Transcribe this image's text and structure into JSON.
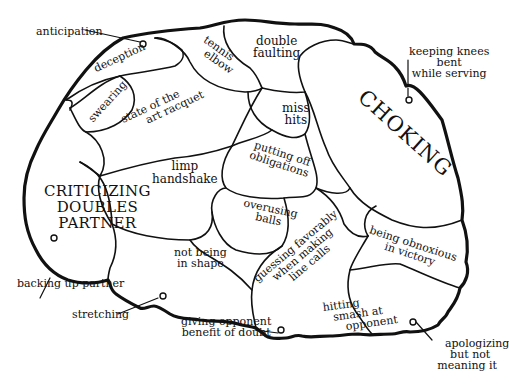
{
  "diagram": {
    "type": "brain-map",
    "stroke_color": "#111111",
    "background": "#ffffff",
    "regions": [
      {
        "id": "deception",
        "lines": [
          "deception"
        ]
      },
      {
        "id": "tennis-elbow",
        "lines": [
          "tennis",
          "elbow"
        ]
      },
      {
        "id": "double-faulting",
        "lines": [
          "double",
          "faulting"
        ]
      },
      {
        "id": "swearing",
        "lines": [
          "swearing"
        ]
      },
      {
        "id": "state-of-the-art-racquet",
        "lines": [
          "state of the",
          "art racquet"
        ]
      },
      {
        "id": "miss-hits",
        "lines": [
          "miss",
          "hits"
        ]
      },
      {
        "id": "choking",
        "lines": [
          "CHOKING"
        ]
      },
      {
        "id": "limp-handshake",
        "lines": [
          "limp",
          "handshake"
        ]
      },
      {
        "id": "putting-off-obligations",
        "lines": [
          "putting off",
          "obligations"
        ]
      },
      {
        "id": "criticizing-doubles-partner",
        "lines": [
          "CRITICIZING",
          "DOUBLES",
          "PARTNER"
        ]
      },
      {
        "id": "overusing-balls",
        "lines": [
          "overusing",
          "balls"
        ]
      },
      {
        "id": "guessing-favorably",
        "lines": [
          "guessing favorably",
          "when making",
          "line calls"
        ]
      },
      {
        "id": "not-being-in-shape",
        "lines": [
          "not being",
          "in shape"
        ]
      },
      {
        "id": "being-obnoxious",
        "lines": [
          "being obnoxious",
          "in victory"
        ]
      },
      {
        "id": "hitting-smash",
        "lines": [
          "hitting",
          "smash at",
          "opponent"
        ]
      }
    ],
    "callouts": [
      {
        "id": "anticipation",
        "lines": [
          "anticipation"
        ]
      },
      {
        "id": "keeping-knees-bent",
        "lines": [
          "keeping knees",
          "bent",
          "while serving"
        ]
      },
      {
        "id": "backing-up-partner",
        "lines": [
          "backing up partner"
        ]
      },
      {
        "id": "stretching",
        "lines": [
          "stretching"
        ]
      },
      {
        "id": "giving-opponent-benefit",
        "lines": [
          "giving opponent",
          "benefit of doubt"
        ]
      },
      {
        "id": "apologizing",
        "lines": [
          "apologizing",
          "but not",
          "meaning it"
        ]
      }
    ]
  }
}
